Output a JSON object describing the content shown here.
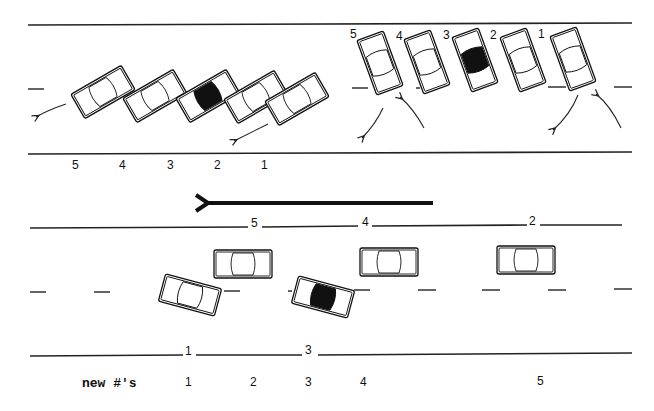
{
  "diagram": {
    "top_left_section": {
      "car_labels": [
        "5",
        "4",
        "3",
        "2",
        "1"
      ],
      "highlighted_car": "2"
    },
    "top_right_section": {
      "car_labels": [
        "5",
        "4",
        "3",
        "2",
        "1"
      ],
      "highlighted_car": "3"
    },
    "direction_arrow": "left",
    "bottom_section": {
      "top_curb_labels": [
        "5",
        "4",
        "2"
      ],
      "bottom_curb_labels": [
        "1",
        "3"
      ],
      "new_numbers_label": "new #'s",
      "new_numbers": [
        "1",
        "2",
        "3",
        "4",
        "5"
      ]
    },
    "colors": {
      "line": "#222222",
      "background": "#ffffff",
      "highlight_roof": "#111111"
    }
  }
}
